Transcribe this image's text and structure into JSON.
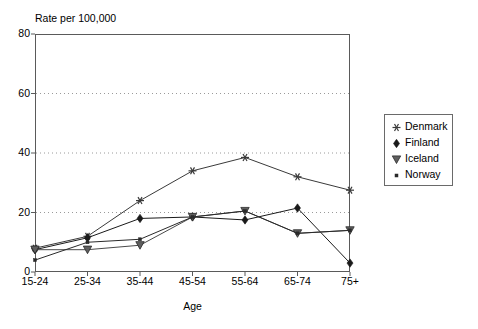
{
  "chart_data": {
    "type": "line",
    "title": "",
    "ylabel": "Rate per 100,000",
    "xlabel": "Age",
    "categories": [
      "15-24",
      "25-34",
      "35-44",
      "45-54",
      "55-64",
      "65-74",
      "75+"
    ],
    "ylim": [
      0,
      80
    ],
    "yticks": [
      0,
      20,
      40,
      60,
      80
    ],
    "grid": "horizontal-dotted",
    "legend_position": "right",
    "series": [
      {
        "name": "Denmark",
        "marker": "asterisk-marker",
        "color": "#3a3a3a",
        "values": [
          8,
          12,
          24,
          34,
          38.5,
          32,
          27.5
        ]
      },
      {
        "name": "Finland",
        "marker": "filled-diamond-marker",
        "color": "#1a1a1a",
        "values": [
          7.5,
          11.5,
          18,
          18.5,
          17.5,
          21.5,
          3
        ]
      },
      {
        "name": "Iceland",
        "marker": "filled-down-triangle-marker",
        "color": "#4a4a4a",
        "values": [
          7.5,
          7.5,
          9,
          18.5,
          20.5,
          13,
          14
        ]
      },
      {
        "name": "Norway",
        "marker": "small-dot-marker",
        "color": "#2a2a2a",
        "values": [
          4,
          10,
          11,
          18.5,
          20.5,
          13,
          14
        ]
      }
    ]
  },
  "axis": {
    "y_title": "Rate per 100,000",
    "x_title": "Age",
    "y_tick_labels": [
      "0",
      "20",
      "40",
      "60",
      "80"
    ],
    "x_tick_labels": [
      "15-24",
      "25-34",
      "35-44",
      "45-54",
      "55-64",
      "65-74",
      "75+"
    ]
  },
  "legend": {
    "entries": [
      {
        "label": "Denmark"
      },
      {
        "label": "Finland"
      },
      {
        "label": "Iceland"
      },
      {
        "label": "Norway"
      }
    ]
  }
}
